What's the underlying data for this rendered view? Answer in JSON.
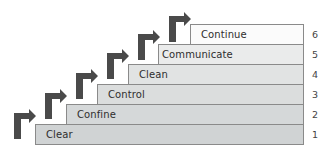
{
  "diagram": {
    "type": "staircase",
    "colors": {
      "arrow": "#4a4a4a",
      "border": "#8a8a8a",
      "step_top": "#fafafa",
      "step_bottom": "#cfd2d3"
    },
    "steps": [
      {
        "number": "1",
        "label": "Clear"
      },
      {
        "number": "2",
        "label": "Confine"
      },
      {
        "number": "3",
        "label": "Control"
      },
      {
        "number": "4",
        "label": "Clean"
      },
      {
        "number": "5",
        "label": "Communicate"
      },
      {
        "number": "6",
        "label": "Continue"
      }
    ]
  }
}
